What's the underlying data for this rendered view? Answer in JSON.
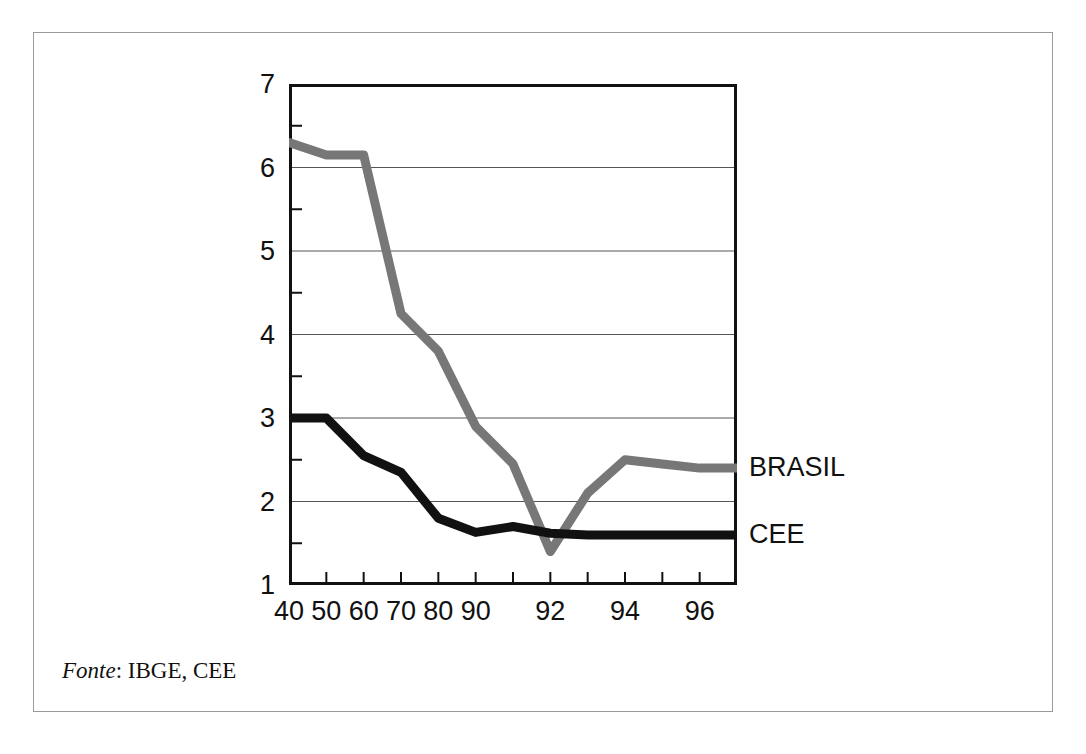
{
  "figure": {
    "source_label": "Fonte",
    "source_separator": ": ",
    "source_value": "IBGE, CEE"
  },
  "series_labels": {
    "brasil": "BRASIL",
    "cee": "CEE"
  },
  "colors": {
    "brasil_line": "#777777",
    "cee_line": "#111111",
    "axis": "#111111",
    "gridline": "#555555",
    "frame": "#9a9a9a",
    "background": "#ffffff"
  },
  "chart_data": {
    "type": "line",
    "title": "",
    "subtitle": "",
    "xlabel": "",
    "ylabel": "",
    "xlim": [
      0,
      12
    ],
    "ylim": [
      1,
      7
    ],
    "grid": true,
    "grid_axis": "y",
    "legend_position": "right-inline",
    "x": [
      0,
      1,
      2,
      3,
      4,
      5,
      6,
      7,
      8,
      9,
      10,
      11,
      12
    ],
    "categories": [
      "40",
      "50",
      "60",
      "70",
      "80",
      "90",
      "91",
      "92",
      "93",
      "94",
      "95",
      "96"
    ],
    "xtick_positions": [
      0,
      1,
      2,
      3,
      4,
      5,
      6,
      7,
      8,
      9,
      10,
      11,
      12
    ],
    "xtick_labels": [
      "40",
      "50",
      "60",
      "70",
      "80",
      "90",
      "",
      "92",
      "",
      "94",
      "",
      "96"
    ],
    "ytick_labels": [
      "1",
      "2",
      "3",
      "4",
      "5",
      "6",
      "7"
    ],
    "ytick_values": [
      1,
      2,
      3,
      4,
      5,
      6,
      7
    ],
    "yminor_values": [
      1.5,
      2.5,
      3.5,
      4.5,
      5.5,
      6.5
    ],
    "series": [
      {
        "name": "BRASIL",
        "color": "#777777",
        "x": [
          0,
          1,
          2,
          3,
          4,
          5,
          6,
          7,
          8,
          9,
          10,
          11,
          12
        ],
        "values": [
          6.3,
          6.15,
          6.15,
          4.25,
          3.8,
          2.9,
          2.45,
          1.4,
          2.1,
          2.5,
          2.45,
          2.4,
          2.4
        ]
      },
      {
        "name": "CEE",
        "color": "#111111",
        "x": [
          0,
          1,
          2,
          3,
          4,
          5,
          6,
          7,
          8,
          9,
          10,
          11,
          12
        ],
        "values": [
          3.0,
          3.0,
          2.55,
          2.35,
          1.8,
          1.63,
          1.7,
          1.62,
          1.6,
          1.6,
          1.6,
          1.6,
          1.6
        ]
      }
    ],
    "annotations": [
      {
        "text": "BRASIL",
        "series": "BRASIL",
        "placement": "right-of-axis",
        "y": 2.4
      },
      {
        "text": "CEE",
        "series": "CEE",
        "placement": "right-of-axis",
        "y": 1.6
      }
    ]
  }
}
